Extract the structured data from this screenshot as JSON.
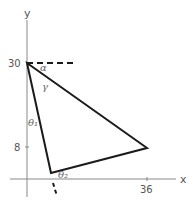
{
  "diagram": {
    "axes": {
      "x_label": "x",
      "y_label": "y",
      "x_ticks": [
        {
          "value": 36,
          "label": "36"
        }
      ],
      "y_ticks": [
        {
          "value": 30,
          "label": "30"
        },
        {
          "value": 8,
          "label": "8"
        }
      ]
    },
    "triangle": {
      "vertices": [
        {
          "name": "top",
          "x": 0,
          "y": 30
        },
        {
          "name": "right",
          "x": 36,
          "y": 8
        },
        {
          "name": "bottom",
          "x": 7,
          "y": 2
        }
      ]
    },
    "angles": {
      "alpha": "α",
      "gamma": "γ",
      "theta1": "θ₁",
      "theta2": "θ₂"
    },
    "colors": {
      "line": "#1a1a1a",
      "axis": "#888888",
      "text": "#555555"
    }
  }
}
